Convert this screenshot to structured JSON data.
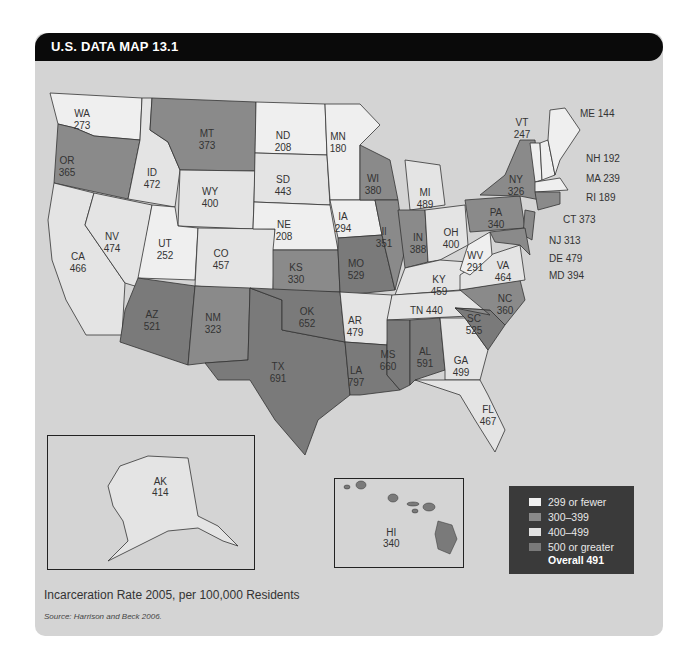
{
  "title": "U.S. DATA MAP 13.1",
  "caption": "Incarceration Rate 2005, per 100,000 Residents",
  "source": "Source: Harrison and Beck 2006.",
  "legend": {
    "items": [
      {
        "label": "299 or fewer",
        "color": "#f0f0f0"
      },
      {
        "label": "300–399",
        "color": "#8a8a8a"
      },
      {
        "label": "400–499",
        "color": "#e2e2e2"
      },
      {
        "label": "500 or greater",
        "color": "#7a7a7a"
      }
    ],
    "overall": "Overall 491"
  },
  "chart_data": {
    "type": "choropleth",
    "title": "Incarceration Rate 2005, per 100,000 Residents",
    "bins": [
      "299 or fewer",
      "300–399",
      "400–499",
      "500 or greater"
    ],
    "overall": 491,
    "states": {
      "WA": 273,
      "OR": 365,
      "CA": 466,
      "ID": 472,
      "NV": 474,
      "MT": 373,
      "WY": 400,
      "UT": 252,
      "CO": 457,
      "AZ": 521,
      "NM": 323,
      "ND": 208,
      "SD": 443,
      "NE": 208,
      "KS": 330,
      "OK": 652,
      "TX": 691,
      "MN": 180,
      "IA": 294,
      "MO": 529,
      "AR": 479,
      "LA": 797,
      "WI": 380,
      "IL": 351,
      "MI": 489,
      "IN": 388,
      "OH": 400,
      "KY": 459,
      "TN": 440,
      "MS": 660,
      "AL": 591,
      "GA": 499,
      "FL": 467,
      "SC": 525,
      "NC": 360,
      "VA": 464,
      "WV": 291,
      "PA": 340,
      "NY": 326,
      "VT": 247,
      "ME": 144,
      "NH": 192,
      "MA": 239,
      "RI": 189,
      "CT": 373,
      "NJ": 313,
      "DE": 479,
      "MD": 394,
      "AK": 414,
      "HI": 340
    },
    "source": "Harrison and Beck 2006"
  },
  "labels": [
    {
      "id": "WA",
      "text": "WA",
      "val": "273",
      "x": 82,
      "y": 117
    },
    {
      "id": "OR",
      "text": "OR",
      "val": "365",
      "x": 67,
      "y": 164
    },
    {
      "id": "CA",
      "text": "CA",
      "val": "466",
      "x": 78,
      "y": 260
    },
    {
      "id": "ID",
      "text": "ID",
      "val": "472",
      "x": 152,
      "y": 176
    },
    {
      "id": "NV",
      "text": "NV",
      "val": "474",
      "x": 112,
      "y": 240
    },
    {
      "id": "MT",
      "text": "MT",
      "val": "373",
      "x": 207,
      "y": 137
    },
    {
      "id": "WY",
      "text": "WY",
      "val": "400",
      "x": 210,
      "y": 195
    },
    {
      "id": "UT",
      "text": "UT",
      "val": "252",
      "x": 165,
      "y": 247
    },
    {
      "id": "CO",
      "text": "CO",
      "val": "457",
      "x": 221,
      "y": 257
    },
    {
      "id": "AZ",
      "text": "AZ",
      "val": "521",
      "x": 152,
      "y": 318
    },
    {
      "id": "NM",
      "text": "NM",
      "val": "323",
      "x": 213,
      "y": 321
    },
    {
      "id": "ND",
      "text": "ND",
      "val": "208",
      "x": 283,
      "y": 139
    },
    {
      "id": "SD",
      "text": "SD",
      "val": "443",
      "x": 283,
      "y": 183
    },
    {
      "id": "NE",
      "text": "NE",
      "val": "208",
      "x": 284,
      "y": 228
    },
    {
      "id": "KS",
      "text": "KS",
      "val": "330",
      "x": 296,
      "y": 271
    },
    {
      "id": "OK",
      "text": "OK",
      "val": "652",
      "x": 307,
      "y": 315
    },
    {
      "id": "TX",
      "text": "TX",
      "val": "691",
      "x": 278,
      "y": 370
    },
    {
      "id": "MN",
      "text": "MN",
      "val": "180",
      "x": 338,
      "y": 140
    },
    {
      "id": "IA",
      "text": "IA",
      "val": "294",
      "x": 343,
      "y": 220
    },
    {
      "id": "MO",
      "text": "MO",
      "val": "529",
      "x": 356,
      "y": 267
    },
    {
      "id": "AR",
      "text": "AR",
      "val": "479",
      "x": 355,
      "y": 324
    },
    {
      "id": "LA",
      "text": "LA",
      "val": "797",
      "x": 356,
      "y": 374
    },
    {
      "id": "WI",
      "text": "WI",
      "val": "380",
      "x": 373,
      "y": 182
    },
    {
      "id": "IL",
      "text": "Il",
      "val": "351",
      "x": 384,
      "y": 235
    },
    {
      "id": "MI",
      "text": "MI",
      "val": "489",
      "x": 425,
      "y": 196
    },
    {
      "id": "IN",
      "text": "IN",
      "val": "388",
      "x": 418,
      "y": 241
    },
    {
      "id": "OH",
      "text": "OH",
      "val": "400",
      "x": 451,
      "y": 236
    },
    {
      "id": "KY",
      "text": "KY",
      "val": "459",
      "x": 439,
      "y": 283
    },
    {
      "id": "MS",
      "text": "MS",
      "val": "660",
      "x": 388,
      "y": 358
    },
    {
      "id": "AL",
      "text": "AL",
      "val": "591",
      "x": 425,
      "y": 355
    },
    {
      "id": "GA",
      "text": "GA",
      "val": "499",
      "x": 461,
      "y": 364
    },
    {
      "id": "FL",
      "text": "FL",
      "val": "467",
      "x": 488,
      "y": 413
    },
    {
      "id": "SC",
      "text": "SC",
      "val": "525",
      "x": 474,
      "y": 322
    },
    {
      "id": "NC",
      "text": "NC",
      "val": "360",
      "x": 505,
      "y": 302
    },
    {
      "id": "VA",
      "text": "VA",
      "val": "464",
      "x": 503,
      "y": 269
    },
    {
      "id": "WV",
      "text": "WV",
      "val": "291",
      "x": 475,
      "y": 259
    },
    {
      "id": "PA",
      "text": "PA",
      "val": "340",
      "x": 496,
      "y": 216
    },
    {
      "id": "NY",
      "text": "NY",
      "val": "326",
      "x": 516,
      "y": 183
    },
    {
      "id": "VT",
      "text": "VT",
      "val": "247",
      "x": 522,
      "y": 126
    }
  ],
  "side_labels": [
    {
      "text": "TN 440",
      "x": 410,
      "y": 314
    },
    {
      "text": "ME 144",
      "x": 580,
      "y": 117
    },
    {
      "text": "NH 192",
      "x": 586,
      "y": 162
    },
    {
      "text": "MA 239",
      "x": 586,
      "y": 182
    },
    {
      "text": "RI 189",
      "x": 586,
      "y": 201
    },
    {
      "text": "CT 373",
      "x": 563,
      "y": 223
    },
    {
      "text": "NJ 313",
      "x": 549,
      "y": 244
    },
    {
      "text": "DE 479",
      "x": 549,
      "y": 262
    },
    {
      "text": "MD 394",
      "x": 549,
      "y": 279
    }
  ],
  "insets": {
    "alaska": {
      "text": "AK",
      "val": "414"
    },
    "hawaii": {
      "text": "HI",
      "val": "340"
    }
  }
}
